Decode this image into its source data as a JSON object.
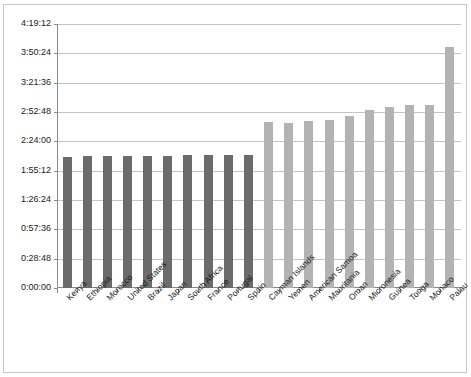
{
  "chart_data": {
    "type": "bar",
    "title": "",
    "subtitle": "",
    "xlabel": "",
    "ylabel": "",
    "grid": true,
    "legend": "none",
    "ylim": [
      "0:00:00",
      "4:19:12"
    ],
    "y_tick_labels": [
      "0:00:00",
      "0:28:48",
      "0:57:36",
      "1:26:24",
      "1:55:12",
      "2:24:00",
      "2:52:48",
      "3:21:36",
      "3:50:24",
      "4:19:12"
    ],
    "y_tick_seconds": [
      0,
      1728,
      3456,
      5184,
      6912,
      8640,
      10368,
      12096,
      13824,
      15552
    ],
    "categories": [
      "Kenya",
      "Ethiopia",
      "Morocco",
      "United States",
      "Brazil",
      "Japan",
      "South Africa",
      "France",
      "Portugal",
      "Spain",
      "Cayman Islands",
      "Yemen",
      "American Samoa",
      "Mauritania",
      "Oman",
      "Micronesia",
      "Guinea",
      "Tonga",
      "Monaco",
      "Palau"
    ],
    "values": [
      "2:09:00",
      "2:09:20",
      "2:09:40",
      "2:09:50",
      "2:10:00",
      "2:10:05",
      "2:10:10",
      "2:10:15",
      "2:10:20",
      "2:10:30",
      "2:43:00",
      "2:42:30",
      "2:43:30",
      "2:45:00",
      "2:49:00",
      "2:55:00",
      "2:57:30",
      "2:59:30",
      "2:59:40",
      "3:56:30"
    ],
    "values_seconds": [
      7740,
      7760,
      7780,
      7790,
      7800,
      7805,
      7810,
      7815,
      7820,
      7830,
      9780,
      9750,
      9810,
      9900,
      10140,
      10500,
      10650,
      10770,
      10780,
      14190
    ],
    "series_groups": [
      {
        "name": "marathon-record-group",
        "color": "#6b6b6b",
        "indices": [
          0,
          1,
          2,
          3,
          4,
          5,
          6,
          7,
          8,
          9
        ]
      },
      {
        "name": "slowest-record-group",
        "color": "#b3b3b3",
        "indices": [
          10,
          11,
          12,
          13,
          14,
          15,
          16,
          17,
          18,
          19
        ]
      }
    ],
    "colors": {
      "bar_dark": "#6b6b6b",
      "bar_light": "#b3b3b3",
      "gridline": "#c4c4c4",
      "axis": "#8a8a8a",
      "frame": "#c8c8c8",
      "text": "#1a1a1a",
      "background": "#ffffff"
    }
  }
}
